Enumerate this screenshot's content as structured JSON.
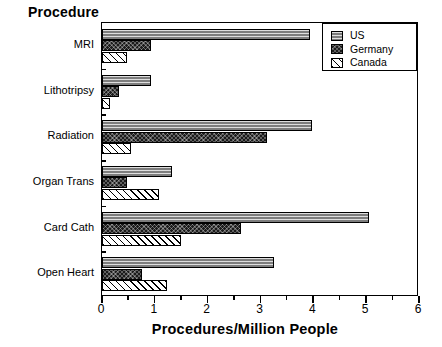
{
  "chart_data": {
    "type": "bar",
    "orientation": "horizontal",
    "title": "",
    "xlabel": "Procedures/Million  People",
    "ylabel": "Procedure",
    "xlim": [
      0,
      6
    ],
    "xticks": [
      0,
      1,
      2,
      3,
      4,
      5,
      6
    ],
    "xtick_labels": [
      "0",
      "1",
      "2",
      "3",
      "4",
      "5",
      "6"
    ],
    "minor_xticks": [
      0.5,
      1.5,
      2.5,
      3.5,
      4.5,
      5.5
    ],
    "grid": false,
    "legend_position": "top-right",
    "categories": [
      "MRI",
      "Lithotripsy",
      "Radiation",
      "Organ Trans",
      "Card Cath",
      "Open Heart"
    ],
    "series": [
      {
        "name": "US",
        "pattern": "horizontal-lines-gray",
        "color": "#7d7d7d",
        "values": [
          3.93,
          0.93,
          3.97,
          1.32,
          5.05,
          3.25
        ]
      },
      {
        "name": "Germany",
        "pattern": "dense-crosshatch-dark",
        "color": "#1b1b1b",
        "values": [
          0.93,
          0.33,
          3.12,
          0.47,
          2.64,
          0.75
        ]
      },
      {
        "name": "Canada",
        "pattern": "diagonal-hatch-white",
        "color": "#ffffff",
        "values": [
          0.47,
          0.15,
          0.55,
          1.08,
          1.5,
          1.23
        ]
      }
    ]
  },
  "legend": {
    "entries": [
      {
        "label": "US"
      },
      {
        "label": "Germany"
      },
      {
        "label": "Canada"
      }
    ]
  }
}
